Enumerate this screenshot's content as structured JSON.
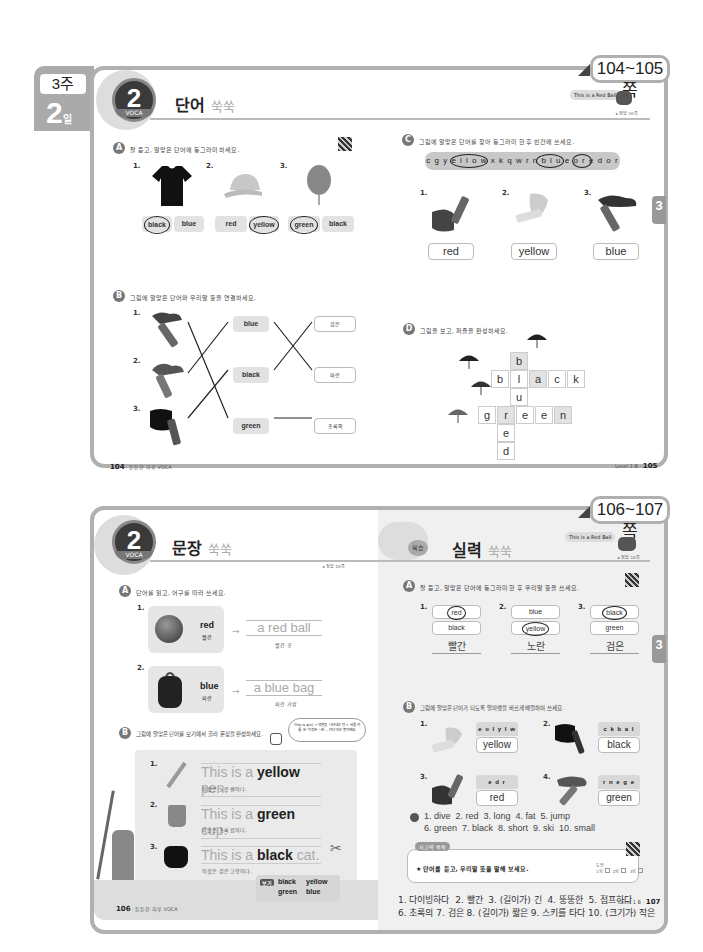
{
  "top_spread": {
    "week_label": "3주",
    "day_num": "2",
    "day_unit": "일",
    "page_range": "104~105쪽",
    "badge": {
      "num": "2",
      "unit": "일",
      "sub": "VOCA",
      "ribbon": "• 튼튼한 하루 •"
    },
    "title": "단어",
    "title_deco": "쑥쑥",
    "book_tag": "This is a Red Ball",
    "answer_ref": "▸ 정답 10쪽",
    "section_a": {
      "marker": "A",
      "instruction": "잘 듣고, 알맞은 단어에 동그라미 하세요.",
      "items": [
        {
          "num": "1.",
          "picture": "black t-shirt",
          "options": [
            "black",
            "blue"
          ],
          "circled": 0
        },
        {
          "num": "2.",
          "picture": "yellow cap",
          "options": [
            "red",
            "yellow"
          ],
          "circled": 1
        },
        {
          "num": "3.",
          "picture": "green balloon",
          "options": [
            "green",
            "black"
          ],
          "circled": 0
        }
      ]
    },
    "section_b": {
      "marker": "B",
      "instruction": "그림에 알맞은 단어와 우리말 뜻을 연결하세요.",
      "pictures": [
        "1.",
        "2.",
        "3."
      ],
      "words": [
        "blue",
        "black",
        "green"
      ],
      "meanings": [
        "검은",
        "파란",
        "초록의"
      ]
    },
    "section_c": {
      "marker": "C",
      "instruction": "그림에 알맞은 단어를 찾아 동그라미 한 후 빈칸에 쓰세요.",
      "letter_strip": "c g y e l l o w x k q w r n b l u e o r e d o r",
      "items": [
        {
          "num": "1.",
          "answer": "red"
        },
        {
          "num": "2.",
          "answer": "yellow"
        },
        {
          "num": "3.",
          "answer": "blue"
        }
      ]
    },
    "section_d": {
      "marker": "D",
      "instruction": "그림을 보고, 퍼즐을 완성하세요.",
      "clue_numbers": [
        "①",
        "②",
        "③",
        "④"
      ],
      "down_blue": [
        "b",
        "l",
        "u",
        "e"
      ],
      "across_black": [
        "b",
        "l",
        "a",
        "c",
        "k"
      ],
      "across_green": [
        "g",
        "r",
        "e",
        "e",
        "n"
      ],
      "down_red": [
        "r",
        "e",
        "d"
      ]
    },
    "side_tab": "3",
    "footer_left": {
      "page": "104",
      "text": "튼튼한 하루 VOCA"
    },
    "footer_right": {
      "text": "Level 1 B",
      "page": "105"
    }
  },
  "bottom_spread": {
    "page_range": "106~107쪽",
    "badge": {
      "num": "2",
      "unit": "일",
      "sub": "VOCA",
      "ribbon": "• 튼튼한 하루 •"
    },
    "title": "문장",
    "title_deco": "쑥쑥",
    "answer_ref_left": "▸ 정답 10쪽",
    "right_title_badge": "복습",
    "right_title": "실력",
    "right_title_deco": "쑥쑥",
    "book_tag": "This is a Red Ball",
    "answer_ref_right": "▸ 정답 10쪽",
    "left_a": {
      "marker": "A",
      "instruction": "단어를 읽고, 어구를 따라 쓰세요.",
      "items": [
        {
          "num": "1.",
          "picture": "red ball",
          "word": "red",
          "meaning": "빨간",
          "phrase": "a red ball",
          "phrase_meaning": "빨간 공"
        },
        {
          "num": "2.",
          "picture": "blue bag",
          "word": "blue",
          "meaning": "파란",
          "phrase": "a blue bag",
          "phrase_meaning": "파란 가방"
        }
      ]
    },
    "left_b": {
      "marker": "B",
      "instruction": "그림에 알맞은 단어를 보기에서 골라 문장을 완성하세요.",
      "tip_bubble": "This is a(n) + 색깔을 나타내는 말 + 사물 이름. 은 '이것은 ~한 …이다'라는 뜻이에요.",
      "sentences": [
        {
          "num": "1.",
          "picture": "pencil",
          "pre": "This is a",
          "word": "yellow",
          "post": "pen.",
          "meaning": "이것은 노란 펜이다."
        },
        {
          "num": "2.",
          "picture": "cup",
          "pre": "This is a",
          "word": "green",
          "post": "cup.",
          "meaning": "이것은 초록 컵이다."
        },
        {
          "num": "3.",
          "picture": "cat",
          "pre": "This is a",
          "word": "black",
          "post": "cat.",
          "meaning": "이것은 검은 고양이다."
        }
      ],
      "word_bank_label": "보기",
      "word_bank": [
        "black",
        "yellow",
        "green",
        "blue"
      ]
    },
    "right_a": {
      "marker": "A",
      "instruction": "잘 듣고, 알맞은 단어에 동그라미 한 후 우리말 뜻을 쓰세요.",
      "items": [
        {
          "num": "1.",
          "options": [
            "red",
            "black"
          ],
          "circled": 0,
          "meaning": "빨간"
        },
        {
          "num": "2.",
          "options": [
            "blue",
            "yellow"
          ],
          "circled": 1,
          "meaning": "노란"
        },
        {
          "num": "3.",
          "options": [
            "black",
            "green"
          ],
          "circled": 0,
          "meaning": "검은"
        }
      ]
    },
    "right_b": {
      "marker": "B",
      "instruction": "그림에 알맞은 단어가 되도록 알파벳을 바르게 배열하여 쓰세요.",
      "items": [
        {
          "num": "1.",
          "scrambled": "e o l y l w",
          "answer": "yellow"
        },
        {
          "num": "2.",
          "scrambled": "c k b a l",
          "answer": "black"
        },
        {
          "num": "3.",
          "scrambled": "e d r",
          "answer": "red"
        },
        {
          "num": "4.",
          "scrambled": "r n e g e",
          "answer": "green"
        }
      ]
    },
    "listening_answers_1": "1. dive  2. red  3. long  4. fat  5. jump",
    "listening_answers_2": "6. green  7. black  8. short  9. ski  10. small",
    "speaking_box": {
      "label": "사고력 쑥쑥",
      "instruction": "★ 단어를 듣고, 우리말 뜻을 말해 보세요.",
      "check_label": "도전",
      "checks": [
        "1회",
        "2회",
        "3회"
      ]
    },
    "korean_answers_1": "1. 다이빙하다  2. 빨간  3. (길이가) 긴  4. 뚱뚱한  5. 점프하다",
    "korean_answers_2": "6. 초록의 7. 검은 8. (길이가) 짧은 9. 스키를 타다 10. (크기가) 작은",
    "side_tab": "3",
    "footer_left": {
      "page": "106",
      "text": "튼튼한 하루 VOCA"
    },
    "footer_right": {
      "text": "Level 1 B",
      "page": "107"
    }
  }
}
